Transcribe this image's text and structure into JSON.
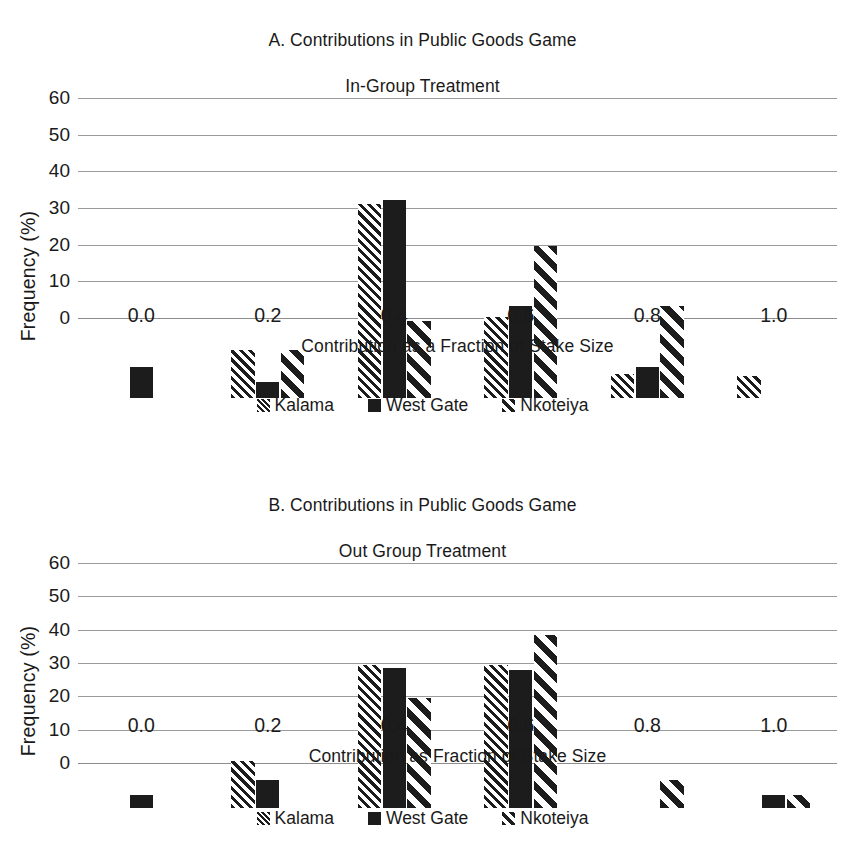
{
  "figure": {
    "ylabel": "Frequency (%)",
    "series_names": [
      "Kalama",
      "West Gate",
      "Nkoteiya"
    ]
  },
  "chart_data": [
    {
      "type": "bar",
      "panel": "A",
      "title": "A.  Contributions in Public Goods Game\nIn-Group Treatment",
      "title_line1": "A.  Contributions in Public Goods Game",
      "title_line2": "In-Group Treatment",
      "xlabel": "Contribution as a Fraction of Stake Size",
      "ylabel": "Frequency (%)",
      "categories": [
        "0.0",
        "0.2",
        "0.4",
        "0.6",
        "0.8",
        "1.0"
      ],
      "ylim": [
        0,
        60
      ],
      "yticks": [
        "60",
        "50",
        "40",
        "30",
        "20",
        "10",
        "0"
      ],
      "grid": true,
      "legend_position": "bottom",
      "series": [
        {
          "name": "Kalama",
          "values": [
            0,
            13,
            53,
            22,
            6.5,
            6
          ]
        },
        {
          "name": "West Gate",
          "values": [
            8.5,
            4.5,
            54,
            25,
            8.5,
            0
          ]
        },
        {
          "name": "Nkoteiya",
          "values": [
            0,
            13,
            21,
            41.5,
            25,
            0
          ]
        }
      ]
    },
    {
      "type": "bar",
      "panel": "B",
      "title": "B.  Contributions in Public Goods Game\nOut Group Treatment",
      "title_line1": "B.  Contributions in Public Goods Game",
      "title_line2": "Out Group Treatment",
      "xlabel": "Contribution as Fraction of Stake Size",
      "ylabel": "Frequency (%)",
      "categories": [
        "0.0",
        "0.2",
        "0.4",
        "0.6",
        "0.8",
        "1.0"
      ],
      "ylim": [
        0,
        60
      ],
      "yticks": [
        "60",
        "50",
        "40",
        "30",
        "20",
        "10",
        "0"
      ],
      "grid": true,
      "legend_position": "bottom",
      "series": [
        {
          "name": "Kalama",
          "values": [
            0,
            14,
            43,
            43,
            0,
            0
          ]
        },
        {
          "name": "West Gate",
          "values": [
            4,
            8.5,
            42,
            41.5,
            0,
            4
          ]
        },
        {
          "name": "Nkoteiya",
          "values": [
            0,
            0,
            33,
            52,
            8.5,
            4
          ]
        }
      ]
    }
  ]
}
